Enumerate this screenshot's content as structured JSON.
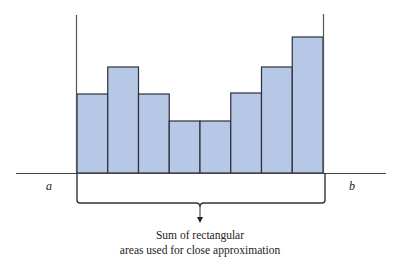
{
  "diagram": {
    "title": "",
    "labels": {
      "a": "a",
      "b": "b"
    },
    "caption": {
      "line1": "Sum of rectangular",
      "line2": "areas used for close approximation"
    },
    "colors": {
      "bar_fill": "#b7c7e6",
      "bar_stroke": "#2a2f3a",
      "axis": "#444444"
    }
  },
  "chart_data": {
    "type": "bar",
    "title": "",
    "categories": [
      "1",
      "2",
      "3",
      "4",
      "5",
      "6",
      "7",
      "8"
    ],
    "values": [
      79,
      106,
      79,
      52,
      52,
      80,
      106,
      136
    ],
    "xlabel": "",
    "ylabel": "",
    "x_endpoints": [
      "a",
      "b"
    ],
    "annotations": [
      "Sum of rectangular areas used for close approximation"
    ],
    "grid": false
  }
}
